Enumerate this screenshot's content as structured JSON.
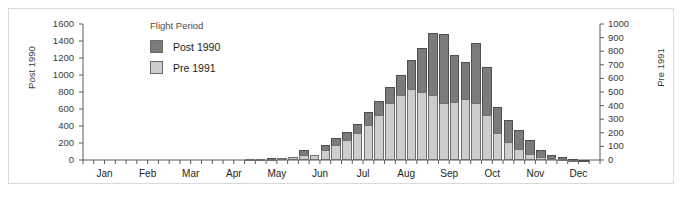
{
  "legend": {
    "title": "Flight Period",
    "entries": [
      {
        "label": "Post 1990",
        "color": "#7b7b7b"
      },
      {
        "label": "Pre 1991",
        "color": "#cdcdcd"
      }
    ]
  },
  "chart_data": {
    "type": "bar",
    "title": "",
    "xlabel": "",
    "ylabel": "Post 1990",
    "ylabel_right": "Pre 1991",
    "grid": false,
    "legend_position": "upper-left-inside",
    "axis_left": {
      "label": "Post 1990",
      "ticks": [
        0,
        200,
        400,
        600,
        800,
        1000,
        1200,
        1400,
        1600
      ],
      "ylim": [
        0,
        1600
      ]
    },
    "axis_right": {
      "label": "Pre 1991",
      "ticks": [
        0,
        100,
        200,
        300,
        400,
        500,
        600,
        700,
        800,
        900,
        1000
      ],
      "ylim": [
        0,
        1000
      ]
    },
    "xaxis": {
      "tick_labels": [
        "Jan",
        "Feb",
        "Mar",
        "Apr",
        "May",
        "Jun",
        "Jul",
        "Aug",
        "Sep",
        "Oct",
        "Nov",
        "Dec"
      ],
      "minor_ticks_per_month": 4,
      "bins": 48,
      "bin_description": "weekly intervals across the year"
    },
    "categories": [
      "Jan w1",
      "Jan w2",
      "Jan w3",
      "Jan w4",
      "Feb w1",
      "Feb w2",
      "Feb w3",
      "Feb w4",
      "Mar w1",
      "Mar w2",
      "Mar w3",
      "Mar w4",
      "Apr w1",
      "Apr w2",
      "Apr w3",
      "Apr w4",
      "May w1",
      "May w2",
      "May w3",
      "May w4",
      "Jun w1",
      "Jun w2",
      "Jun w3",
      "Jun w4",
      "Jul w1",
      "Jul w2",
      "Jul w3",
      "Jul w4",
      "Aug w1",
      "Aug w2",
      "Aug w3",
      "Aug w4",
      "Sep w1",
      "Sep w2",
      "Sep w3",
      "Sep w4",
      "Oct w1",
      "Oct w2",
      "Oct w3",
      "Oct w4",
      "Nov w1",
      "Nov w2",
      "Nov w3",
      "Nov w4",
      "Dec w1",
      "Dec w2",
      "Dec w3",
      "Dec w4"
    ],
    "series": [
      {
        "name": "Post 1990",
        "axis": "left",
        "color": "#7b7b7b",
        "values": [
          0,
          0,
          0,
          0,
          0,
          0,
          0,
          0,
          0,
          0,
          0,
          0,
          0,
          0,
          0,
          10,
          15,
          20,
          25,
          40,
          120,
          60,
          180,
          260,
          330,
          420,
          560,
          700,
          860,
          1000,
          1180,
          1320,
          1500,
          1480,
          1240,
          1150,
          1380,
          1090,
          620,
          470,
          350,
          230,
          120,
          60,
          30,
          15,
          5,
          0
        ]
      },
      {
        "name": "Pre 1991",
        "axis": "right",
        "color": "#cdcdcd",
        "values": [
          0,
          0,
          0,
          0,
          0,
          0,
          0,
          0,
          0,
          0,
          0,
          0,
          0,
          0,
          0,
          5,
          8,
          10,
          15,
          25,
          35,
          40,
          70,
          110,
          150,
          200,
          260,
          330,
          420,
          480,
          520,
          500,
          480,
          420,
          430,
          450,
          420,
          330,
          200,
          130,
          80,
          45,
          25,
          12,
          6,
          3,
          0,
          0
        ]
      }
    ]
  }
}
